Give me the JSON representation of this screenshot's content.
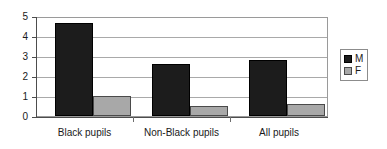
{
  "chart_data": {
    "type": "bar",
    "title": "",
    "subtitle": "",
    "xlabel": "",
    "ylabel": "",
    "categories": [
      "Black pupils",
      "Non-Black pupils",
      "All pupils"
    ],
    "series": [
      {
        "name": "M",
        "values": [
          4.72,
          2.65,
          2.85
        ],
        "color": "#1c1c1c"
      },
      {
        "name": "F",
        "values": [
          1.0,
          0.5,
          0.6
        ],
        "color": "#a8a8a8"
      }
    ],
    "ylim": [
      0,
      5
    ],
    "yticks": [
      0,
      1,
      2,
      3,
      4,
      5
    ],
    "ytick_labels": [
      "0",
      "1",
      "2",
      "3",
      "4",
      "5"
    ],
    "grid": true,
    "grid_axis": "y",
    "legend": {
      "position": "right",
      "entries": [
        {
          "label": "M",
          "color": "#1c1c1c"
        },
        {
          "label": "F",
          "color": "#a8a8a8"
        }
      ]
    }
  }
}
